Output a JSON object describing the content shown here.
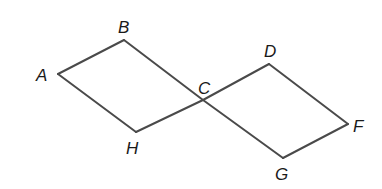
{
  "diagram": {
    "type": "geometry",
    "points": [
      {
        "id": "A",
        "label": "A"
      },
      {
        "id": "B",
        "label": "B"
      },
      {
        "id": "C",
        "label": "C"
      },
      {
        "id": "D",
        "label": "D"
      },
      {
        "id": "F",
        "label": "F"
      },
      {
        "id": "G",
        "label": "G"
      },
      {
        "id": "H",
        "label": "H"
      }
    ],
    "segments": [
      [
        "A",
        "B"
      ],
      [
        "B",
        "C"
      ],
      [
        "C",
        "G"
      ],
      [
        "G",
        "F"
      ],
      [
        "F",
        "D"
      ],
      [
        "D",
        "C"
      ],
      [
        "C",
        "H"
      ],
      [
        "H",
        "A"
      ]
    ],
    "stroke_color": "#4a4a4a",
    "label_color": "#1a1a1a"
  }
}
